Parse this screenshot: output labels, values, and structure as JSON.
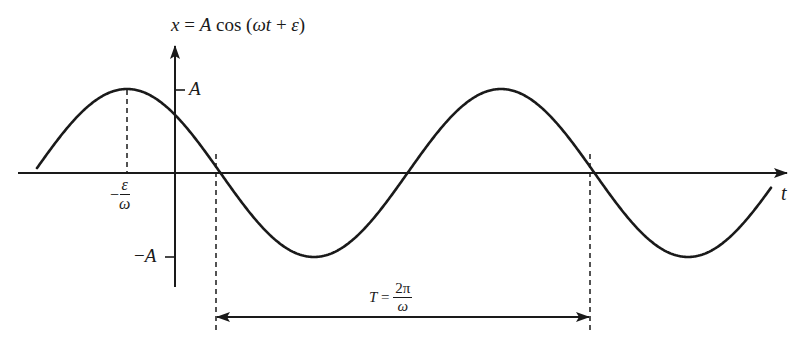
{
  "diagram": {
    "title_equation": {
      "lhs": "x",
      "eq": " = ",
      "amp": "A",
      "func": " cos (",
      "omega_t": "ωt",
      "plus": " + ",
      "eps": "ε",
      "close": ")"
    },
    "y_axis": {
      "tick_top_label": "A",
      "tick_bottom_sign": "−",
      "tick_bottom_label": "A"
    },
    "x_axis": {
      "label": "t"
    },
    "phase_label": {
      "sign": "−",
      "numerator": "ε",
      "denominator": "ω"
    },
    "period_label": {
      "lhs": "T",
      "eq": " = ",
      "numerator": "2π",
      "denominator": "ω"
    },
    "colors": {
      "stroke": "#1a1a1a",
      "background": "#ffffff"
    }
  },
  "chart_data": {
    "type": "line",
    "title": "x = A cos (ωt + ε)",
    "xlabel": "t",
    "ylabel": "x",
    "function": "x = A cos(ωt + ε)",
    "y_ticks": [
      "A",
      "−A"
    ],
    "annotations": [
      "−ε/ω (time of first maximum)",
      "T = 2π/ω (period, marked between consecutive downward zero crossings)"
    ],
    "pixel_geometry": {
      "origin": [
        175,
        173
      ],
      "amplitude_px": 84,
      "period_px": 374,
      "first_peak_x": 127,
      "zero_crossings_x": [
        216,
        402,
        590
      ],
      "curve_x_range": [
        37,
        771
      ]
    },
    "grid": false,
    "legend": "none"
  }
}
